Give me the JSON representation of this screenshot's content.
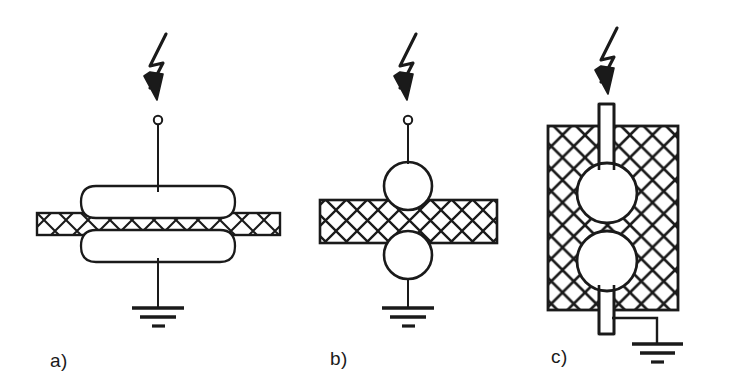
{
  "figure": {
    "background_color": "#ffffff",
    "ink_color": "#1a1a1a",
    "width": 740,
    "height": 386
  },
  "panels": [
    {
      "id": "a",
      "label": "a)",
      "description": "Disc-type wall bushing: two flattened electrode sheds straddling a thin hatched wall",
      "icons": {
        "lightning": "lightning-bolt-strike-arrow",
        "terminal": "terminal-node-circle",
        "ground": "earth-ground-symbol",
        "wall": "hatched-wall-thin"
      },
      "geometry": {
        "bolt_x": 158,
        "terminal_cx": 158,
        "terminal_cy": 120,
        "terminal_r": 4,
        "wire_top_y": 124,
        "wire_top_end_y": 190,
        "shed_top": {
          "cx": 158,
          "cy": 202,
          "rx": 78,
          "ry": 17
        },
        "shed_bottom": {
          "cx": 158,
          "cy": 246,
          "rx": 78,
          "ry": 17
        },
        "wall": {
          "x": 37,
          "y": 213,
          "w": 243,
          "h": 22,
          "rows": 1
        },
        "wire_bottom_y1": 262,
        "wire_bottom_y2": 308,
        "ground_y": 308
      }
    },
    {
      "id": "b",
      "label": "b)",
      "description": "Sphere-electrode wall bushing: two tangent circles crossing a thicker hatched wall",
      "icons": {
        "lightning": "lightning-bolt-strike-arrow",
        "terminal": "terminal-node-circle",
        "ground": "earth-ground-symbol",
        "wall": "hatched-wall-lattice"
      },
      "geometry": {
        "bolt_x": 408,
        "terminal_cx": 408,
        "terminal_cy": 120,
        "terminal_r": 4,
        "wire_top_y": 124,
        "wire_top_end_y": 162,
        "circle_top": {
          "cx": 408,
          "cy": 186,
          "r": 24
        },
        "circle_bottom": {
          "cx": 408,
          "cy": 255,
          "r": 24
        },
        "wall": {
          "x": 320,
          "y": 200,
          "w": 177,
          "h": 43
        },
        "wire_bottom_y1": 279,
        "wire_bottom_y2": 308,
        "ground_y": 308
      }
    },
    {
      "id": "c",
      "label": "c)",
      "description": "Embedded electrode block: two circles inside a large hatched body with bar electrodes top and bottom",
      "icons": {
        "lightning": "lightning-bolt-strike-arrow",
        "ground": "earth-ground-symbol",
        "wall": "hatched-block-lattice",
        "electrode": "bar-electrode"
      },
      "geometry": {
        "bolt_x": 607,
        "block": {
          "x": 548,
          "y": 126,
          "w": 130,
          "h": 184
        },
        "bar_top": {
          "x": 598,
          "y": 104,
          "w": 17,
          "h": 86
        },
        "bar_bottom": {
          "x": 598,
          "y": 258,
          "w": 17,
          "h": 76
        },
        "circle_top": {
          "cx": 607,
          "cy": 193,
          "r": 30
        },
        "circle_bottom": {
          "cx": 607,
          "cy": 261,
          "r": 30
        },
        "ground_lead_x": 657,
        "ground_lead_y": 318,
        "ground_y": 344
      }
    }
  ]
}
